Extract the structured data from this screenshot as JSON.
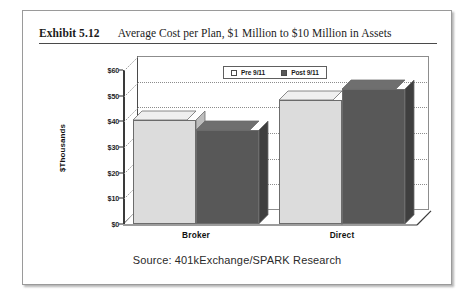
{
  "exhibit": {
    "number": "Exhibit 5.12",
    "title": "Average Cost per Plan, $1 Million to $10 Million in Assets"
  },
  "source": {
    "caption": "Source: 401kExchange/SPARK Research"
  },
  "colors": {
    "pre_911_fill": "#dcdcdc",
    "post_911_fill": "#585858",
    "pre_911_top": "#efefef",
    "post_911_top": "#6f6f6f",
    "pre_911_side": "#bdbdbd",
    "post_911_side": "#3f3f3f",
    "axis": "#3a3a3a",
    "gridline": "#8c8c8c",
    "frame": "#9a9a9a",
    "floor": "#ffffff"
  },
  "chart_data": {
    "type": "bar",
    "title": "Average Cost per Plan, $1 Million to $10 Million in Assets",
    "xlabel": "",
    "ylabel": "$Thousands",
    "categories": [
      "Broker",
      "Direct"
    ],
    "series": [
      {
        "name": "Pre 9/11",
        "values": [
          40.5,
          48.5
        ]
      },
      {
        "name": "Post 9/11",
        "values": [
          36.5,
          52.5
        ]
      }
    ],
    "ylim": [
      0,
      60
    ],
    "yticks": [
      0,
      10,
      20,
      30,
      40,
      50,
      60
    ],
    "ytick_labels": [
      "$0",
      "$10",
      "$20",
      "$30",
      "$40",
      "$50",
      "$60"
    ],
    "grid": true,
    "legend_position": "top-left",
    "projection": "3d-columns"
  },
  "legend": {
    "items": [
      {
        "label": "Pre 9/11",
        "swatch": "light"
      },
      {
        "label": "Post 9/11",
        "swatch": "dark"
      }
    ]
  }
}
